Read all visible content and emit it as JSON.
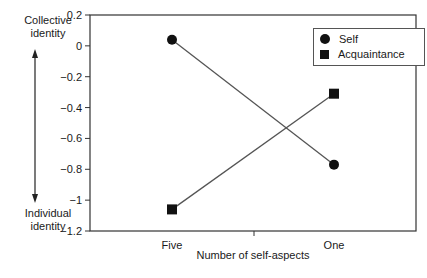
{
  "chart_data": {
    "type": "line",
    "title": "",
    "xlabel": "Number of self-aspects",
    "ylabel": "",
    "categories": [
      "Five",
      "One"
    ],
    "series": [
      {
        "name": "Self",
        "marker": "circle",
        "values": [
          0.04,
          -0.77
        ]
      },
      {
        "name": "Acquaintance",
        "marker": "square",
        "values": [
          -1.06,
          -0.31
        ]
      }
    ],
    "ylim": [
      -1.2,
      0.2
    ],
    "yticks": [
      0.2,
      0,
      -0.2,
      -0.4,
      -0.6,
      -0.8,
      -1,
      -1.2
    ],
    "ytick_labels": [
      "0.2",
      "0",
      "−0.2",
      "−0.4",
      "−0.6",
      "−0.8",
      "−1",
      "−1.2"
    ],
    "grid": false,
    "legend_position": "upper right",
    "annotations": {
      "top": "Collective identity",
      "bottom": "Individual identity",
      "arrow": "double-headed vertical arrow"
    }
  },
  "labels": {
    "top_line1": "Collective",
    "top_line2": "identity",
    "bottom_line1": "Individual",
    "bottom_line2": "identity",
    "xlabel": "Number of self-aspects",
    "legend_self": "Self",
    "legend_acq": "Acquaintance"
  },
  "colors": {
    "line": "#555555",
    "marker": "#111111",
    "axis": "#333333"
  }
}
